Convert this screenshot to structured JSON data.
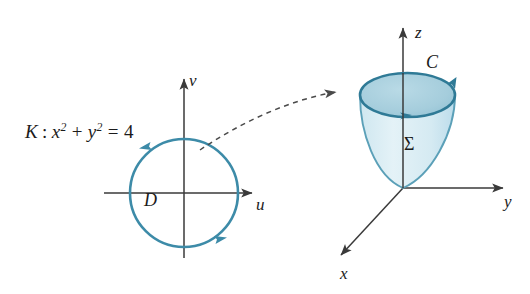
{
  "figure": {
    "type": "math-diagram",
    "background_color": "#ffffff"
  },
  "colors": {
    "curve_teal": "#3d8ba8",
    "curve_teal_dark": "#2f7a96",
    "surface_top_fill": "#a8cfdd",
    "surface_body_fill": "#dff0f5",
    "axis_black": "#3a3a3a",
    "text_black": "#1b1b1b",
    "dashed_arrow": "#4a4a4a"
  },
  "left_panel": {
    "equation_label": "K : x² + y² = 4",
    "equation_parts": {
      "curve_name": "K",
      "colon": ":",
      "term1_base": "x",
      "term1_exp": "2",
      "plus": "+",
      "term2_base": "y",
      "term2_exp": "2",
      "equals": "=",
      "value": "4"
    },
    "axis_horizontal_label": "u",
    "axis_vertical_label": "v",
    "region_label": "D",
    "circle": {
      "center_x": 184,
      "center_y": 193,
      "radius": 54,
      "orientation": "counterclockwise",
      "arrow_count": 2
    }
  },
  "transfer_arrow": {
    "style": "dashed-curved",
    "direction": "left-to-right",
    "has_arrowhead": true
  },
  "right_panel": {
    "axis_x_label": "x",
    "axis_y_label": "y",
    "axis_z_label": "z",
    "boundary_curve_label": "C",
    "surface_label": "Σ",
    "surface_shape": "paraboloid",
    "boundary_orientation": "counterclockwise",
    "arrow_count": 2,
    "origin": {
      "x": 403,
      "y": 188
    }
  }
}
